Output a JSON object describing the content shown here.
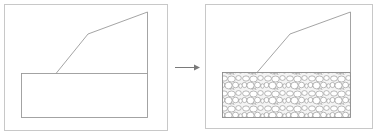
{
  "diagram": {
    "title": "",
    "panels": [
      {
        "name": "before",
        "fill": "none",
        "description": "slope profile above empty rectangular base layer"
      },
      {
        "name": "after",
        "fill": "gravel-hatch",
        "description": "slope profile above gravel-filled base layer"
      }
    ],
    "arrow": {
      "direction": "right"
    },
    "colors": {
      "frame": "#c8c8c8",
      "line": "#9a9a9a",
      "arrow": "#7a7a7a",
      "hatch": "#8c8c8c",
      "background": "#ffffff"
    }
  }
}
